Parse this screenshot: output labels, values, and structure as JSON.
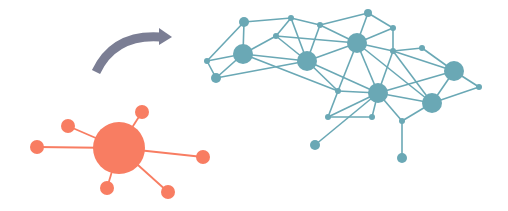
{
  "diagram": {
    "colors": {
      "centralized": "#f87d62",
      "arrow": "#7b7e94",
      "decentralized": "#6aa8b5",
      "background": "#ffffff"
    },
    "centralized_network": {
      "hub": {
        "x": 119,
        "y": 148,
        "r": 26
      },
      "satellites": [
        {
          "x": 142,
          "y": 112,
          "r": 7
        },
        {
          "x": 68,
          "y": 126,
          "r": 7
        },
        {
          "x": 37,
          "y": 147,
          "r": 7
        },
        {
          "x": 203,
          "y": 157,
          "r": 7
        },
        {
          "x": 107,
          "y": 188,
          "r": 7
        },
        {
          "x": 168,
          "y": 192,
          "r": 7
        }
      ]
    },
    "arrow": {
      "from": [
        96,
        72
      ],
      "to": [
        172,
        36
      ],
      "label": ""
    },
    "decentralized_network": {
      "nodes": [
        {
          "id": "a",
          "x": 244,
          "y": 22,
          "r": 5
        },
        {
          "id": "b",
          "x": 291,
          "y": 18,
          "r": 3
        },
        {
          "id": "c",
          "x": 320,
          "y": 25,
          "r": 3
        },
        {
          "id": "d",
          "x": 368,
          "y": 13,
          "r": 4
        },
        {
          "id": "e",
          "x": 393,
          "y": 28,
          "r": 3
        },
        {
          "id": "f",
          "x": 276,
          "y": 36,
          "r": 3
        },
        {
          "id": "g",
          "x": 243,
          "y": 54,
          "r": 10
        },
        {
          "id": "h",
          "x": 307,
          "y": 61,
          "r": 10
        },
        {
          "id": "i",
          "x": 357,
          "y": 43,
          "r": 10
        },
        {
          "id": "j",
          "x": 207,
          "y": 61,
          "r": 3
        },
        {
          "id": "k",
          "x": 216,
          "y": 78,
          "r": 5
        },
        {
          "id": "l",
          "x": 393,
          "y": 51,
          "r": 3
        },
        {
          "id": "m",
          "x": 422,
          "y": 48,
          "r": 3
        },
        {
          "id": "n",
          "x": 454,
          "y": 71,
          "r": 10
        },
        {
          "id": "o",
          "x": 479,
          "y": 87,
          "r": 3
        },
        {
          "id": "p",
          "x": 338,
          "y": 91,
          "r": 3
        },
        {
          "id": "q",
          "x": 378,
          "y": 93,
          "r": 10
        },
        {
          "id": "r",
          "x": 432,
          "y": 103,
          "r": 10
        },
        {
          "id": "s",
          "x": 328,
          "y": 117,
          "r": 3
        },
        {
          "id": "t",
          "x": 372,
          "y": 117,
          "r": 3
        },
        {
          "id": "u",
          "x": 402,
          "y": 121,
          "r": 3
        },
        {
          "id": "v",
          "x": 315,
          "y": 145,
          "r": 5
        },
        {
          "id": "w",
          "x": 402,
          "y": 158,
          "r": 5
        }
      ],
      "edges": [
        [
          "a",
          "b"
        ],
        [
          "a",
          "g"
        ],
        [
          "a",
          "j"
        ],
        [
          "b",
          "f"
        ],
        [
          "b",
          "c"
        ],
        [
          "b",
          "h"
        ],
        [
          "c",
          "d"
        ],
        [
          "c",
          "i"
        ],
        [
          "c",
          "h"
        ],
        [
          "d",
          "i"
        ],
        [
          "d",
          "e"
        ],
        [
          "e",
          "i"
        ],
        [
          "e",
          "l"
        ],
        [
          "f",
          "g"
        ],
        [
          "f",
          "h"
        ],
        [
          "f",
          "i"
        ],
        [
          "g",
          "j"
        ],
        [
          "g",
          "k"
        ],
        [
          "g",
          "h"
        ],
        [
          "g",
          "p"
        ],
        [
          "j",
          "k"
        ],
        [
          "k",
          "h"
        ],
        [
          "h",
          "i"
        ],
        [
          "h",
          "p"
        ],
        [
          "h",
          "q"
        ],
        [
          "i",
          "l"
        ],
        [
          "i",
          "q"
        ],
        [
          "i",
          "r"
        ],
        [
          "i",
          "p"
        ],
        [
          "l",
          "m"
        ],
        [
          "l",
          "q"
        ],
        [
          "l",
          "n"
        ],
        [
          "m",
          "n"
        ],
        [
          "n",
          "o"
        ],
        [
          "n",
          "r"
        ],
        [
          "n",
          "q"
        ],
        [
          "o",
          "r"
        ],
        [
          "p",
          "q"
        ],
        [
          "p",
          "s"
        ],
        [
          "q",
          "s"
        ],
        [
          "q",
          "t"
        ],
        [
          "q",
          "r"
        ],
        [
          "q",
          "u"
        ],
        [
          "q",
          "v"
        ],
        [
          "s",
          "t"
        ],
        [
          "r",
          "u"
        ],
        [
          "u",
          "w"
        ],
        [
          "l",
          "r"
        ]
      ]
    }
  }
}
